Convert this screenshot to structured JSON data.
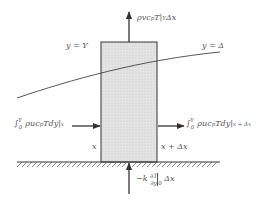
{
  "diagram": {
    "type": "control-volume boundary layer energy balance",
    "colors": {
      "line": "#333333",
      "fill": "#dcdcdc",
      "text": "#555555",
      "hatch": "#555555"
    },
    "labels": {
      "top_flux": "ρvc",
      "top_flux_sub": "p",
      "top_flux_rest": "T|",
      "top_flux_eval": "Y",
      "top_flux_dx": "Δx",
      "y_eq_Y": "y = Y",
      "y_eq_delta": "y = Δ",
      "left_flux_int": "∫",
      "left_flux_lims_upper": "Y",
      "left_flux_lims_lower": "0",
      "left_flux_body": "ρuc",
      "left_flux_sub": "p",
      "left_flux_rest": "Tdy|",
      "left_flux_eval": "x",
      "right_flux_int": "∫",
      "right_flux_lims_upper": "Y",
      "right_flux_lims_lower": "0",
      "right_flux_body": "ρuc",
      "right_flux_sub": "p",
      "right_flux_rest": "Tdy|",
      "right_flux_eval": "x + Δx",
      "x_left": "x",
      "x_right": "x + Δx",
      "wall_flux_prefix": "−k",
      "wall_flux_num": "∂T",
      "wall_flux_den": "∂y",
      "wall_flux_eval": "0",
      "wall_flux_dx": "Δx"
    }
  }
}
